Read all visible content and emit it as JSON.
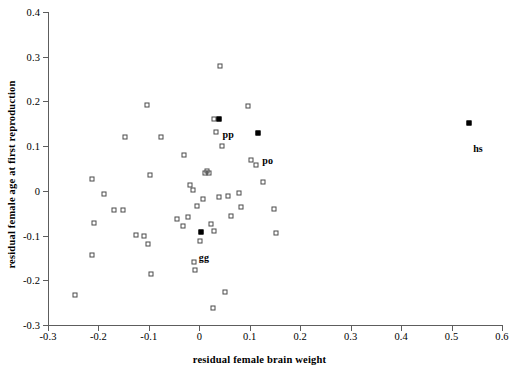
{
  "chart_data": {
    "type": "scatter",
    "title": "",
    "xlabel": "residual female brain weight",
    "ylabel": "residual female age at first reproduction",
    "xlim": [
      -0.3,
      0.6
    ],
    "ylim": [
      -0.3,
      0.4
    ],
    "xticks": [
      "-0.3",
      "-0.2",
      "-0.1",
      "0",
      "0.1",
      "0.2",
      "0.3",
      "0.4",
      "0.5",
      "0.6"
    ],
    "xtick_values": [
      -0.3,
      -0.2,
      -0.1,
      0,
      0.1,
      0.2,
      0.3,
      0.4,
      0.5,
      0.6
    ],
    "yticks": [
      "0.4",
      "0.3",
      "0.2",
      "0.1",
      "0",
      "-0.1",
      "-0.2",
      "-0.3"
    ],
    "ytick_values": [
      0.4,
      0.3,
      0.2,
      0.1,
      0,
      -0.1,
      -0.2,
      -0.3
    ],
    "grid": false,
    "legend": "none",
    "series": [
      {
        "name": "other species",
        "marker": "open-square",
        "points": [
          {
            "x": -0.247,
            "y": -0.232
          },
          {
            "x": -0.213,
            "y": 0.026
          },
          {
            "x": -0.209,
            "y": -0.071
          },
          {
            "x": -0.213,
            "y": -0.143
          },
          {
            "x": -0.188,
            "y": -0.008
          },
          {
            "x": -0.17,
            "y": -0.042
          },
          {
            "x": -0.151,
            "y": -0.043
          },
          {
            "x": -0.148,
            "y": 0.121
          },
          {
            "x": -0.126,
            "y": -0.099
          },
          {
            "x": -0.11,
            "y": -0.102
          },
          {
            "x": -0.103,
            "y": 0.191
          },
          {
            "x": -0.101,
            "y": -0.118
          },
          {
            "x": -0.097,
            "y": 0.035
          },
          {
            "x": -0.095,
            "y": -0.187
          },
          {
            "x": -0.076,
            "y": 0.121
          },
          {
            "x": -0.045,
            "y": -0.063
          },
          {
            "x": -0.032,
            "y": -0.078
          },
          {
            "x": -0.03,
            "y": 0.081
          },
          {
            "x": -0.022,
            "y": -0.058
          },
          {
            "x": -0.018,
            "y": 0.012
          },
          {
            "x": -0.012,
            "y": 0.002
          },
          {
            "x": -0.01,
            "y": -0.159
          },
          {
            "x": -0.008,
            "y": -0.178
          },
          {
            "x": -0.005,
            "y": -0.034
          },
          {
            "x": 0.001,
            "y": -0.112
          },
          {
            "x": 0.007,
            "y": -0.018
          },
          {
            "x": 0.012,
            "y": 0.039
          },
          {
            "x": 0.016,
            "y": 0.044
          },
          {
            "x": 0.019,
            "y": 0.041
          },
          {
            "x": 0.024,
            "y": -0.074
          },
          {
            "x": 0.027,
            "y": -0.262
          },
          {
            "x": 0.029,
            "y": -0.089
          },
          {
            "x": 0.03,
            "y": 0.16
          },
          {
            "x": 0.034,
            "y": 0.131
          },
          {
            "x": 0.038,
            "y": -0.014
          },
          {
            "x": 0.04,
            "y": 0.279
          },
          {
            "x": 0.044,
            "y": 0.101
          },
          {
            "x": 0.05,
            "y": -0.226
          },
          {
            "x": 0.056,
            "y": -0.012
          },
          {
            "x": 0.062,
            "y": -0.057
          },
          {
            "x": 0.078,
            "y": -0.005
          },
          {
            "x": 0.082,
            "y": -0.036
          },
          {
            "x": 0.097,
            "y": 0.189
          },
          {
            "x": 0.103,
            "y": 0.068
          },
          {
            "x": 0.113,
            "y": 0.058
          },
          {
            "x": 0.127,
            "y": 0.019
          },
          {
            "x": 0.148,
            "y": -0.04
          },
          {
            "x": 0.152,
            "y": -0.094
          }
        ]
      },
      {
        "name": "great apes",
        "marker": "filled-square",
        "points": [
          {
            "x": 0.038,
            "y": 0.16,
            "label": "pp",
            "label_dx": 4,
            "label_dy": 10
          },
          {
            "x": 0.117,
            "y": 0.129,
            "label": "po",
            "label_dx": 4,
            "label_dy": 22
          },
          {
            "x": 0.003,
            "y": -0.092,
            "label": "gg",
            "label_dx": -2,
            "label_dy": 20
          },
          {
            "x": 0.535,
            "y": 0.152,
            "label": "hs",
            "label_dx": 4,
            "label_dy": 20
          }
        ]
      }
    ]
  }
}
